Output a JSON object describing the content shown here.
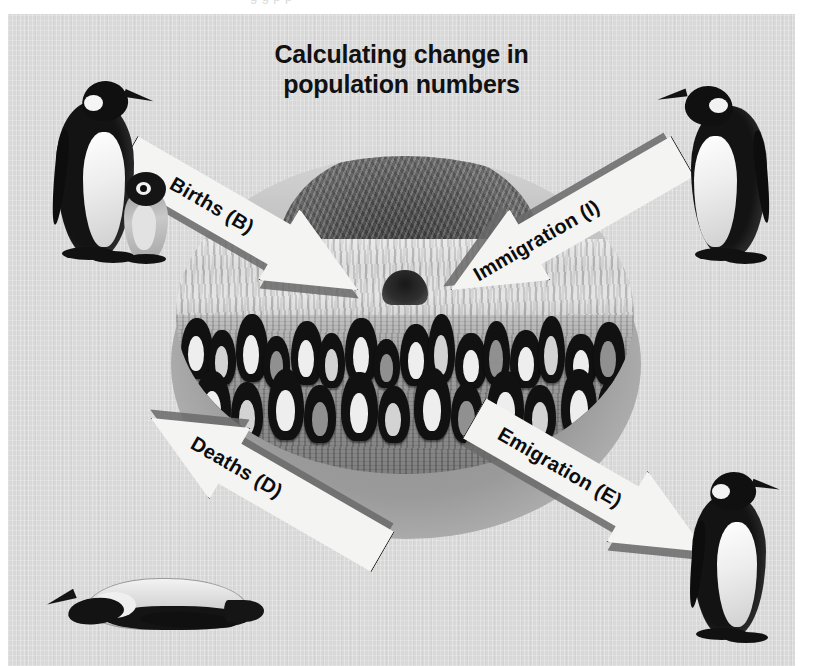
{
  "slide": {
    "title_line1": "Calculating change in",
    "title_line2": "population numbers",
    "background_color": "#d8d8d8",
    "page_background_color": "#ffffff",
    "top_ghost_text": "g g  p p"
  },
  "diagram": {
    "center_photo_caption": "Penguin colony with iceberg and mountain backdrop",
    "arrows": [
      {
        "id": "births",
        "label": "Births (B)",
        "direction": "inward",
        "position": "top-left",
        "points": "down-right toward colony"
      },
      {
        "id": "immigration",
        "label": "Immigration (I)",
        "direction": "inward",
        "position": "top-right",
        "points": "down-left toward colony"
      },
      {
        "id": "deaths",
        "label": "Deaths (D)",
        "direction": "outward",
        "position": "bottom-left",
        "points": "down-left away from colony"
      },
      {
        "id": "emigration",
        "label": "Emigration (E)",
        "direction": "outward",
        "position": "bottom-right",
        "points": "down-right away from colony"
      }
    ],
    "illustrations": [
      {
        "id": "adult-with-chick",
        "position": "top-left",
        "description": "Adult emperor penguin standing beside a downy chick"
      },
      {
        "id": "adult-facing-left",
        "position": "top-right",
        "description": "Adult emperor penguin facing left"
      },
      {
        "id": "dead-penguin",
        "position": "bottom-left",
        "description": "Dead penguin lying on its side"
      },
      {
        "id": "adult-facing-right",
        "position": "bottom-right",
        "description": "Adult emperor penguin facing right"
      }
    ]
  },
  "colors": {
    "slide_bg": "#d8d8d8",
    "arrow_fill": "#f4f4f2",
    "arrow_outline": "#1b1b1b",
    "arrow_shadow": "#6a6a6a",
    "text": "#111111"
  }
}
